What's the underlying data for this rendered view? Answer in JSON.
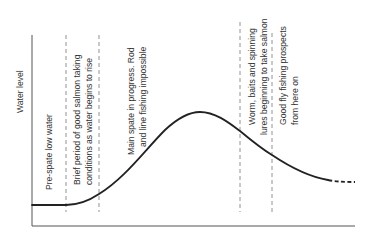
{
  "diagram": {
    "type": "annotated-curve",
    "y_axis_label": "Water level",
    "x_axis_label": "",
    "curve": {
      "description": "Spate hydrograph: flat low water, rising limb, peak, falling limb trailing off (dashed)",
      "points_px": [
        [
          32,
          205
        ],
        [
          66,
          205
        ],
        [
          99,
          194
        ],
        [
          165,
          130
        ],
        [
          200,
          112
        ],
        [
          240,
          131
        ],
        [
          272,
          155
        ],
        [
          328,
          180
        ],
        [
          355,
          182
        ]
      ],
      "dashed_tail_from_x": 328
    },
    "phases": [
      {
        "lines": [
          "Pre-spate low water"
        ],
        "divider_x": 66
      },
      {
        "lines": [
          "Brief period of good salmon taking",
          "conditions as water begins to rise"
        ],
        "divider_x": 99
      },
      {
        "lines": [
          "Main spate in progress. Rod",
          "and line fishing impossible"
        ],
        "divider_x": null
      },
      {
        "lines": [
          "Worm, baits and spinning",
          "lures beginning to take salmon"
        ],
        "divider_x": 240
      },
      {
        "lines": [
          "Good fly fishing prospects",
          "from here on"
        ],
        "divider_x": 272
      }
    ],
    "colors": {
      "curve": "#222222",
      "axis": "#555555",
      "divider": "#777777",
      "text": "#333333"
    }
  }
}
